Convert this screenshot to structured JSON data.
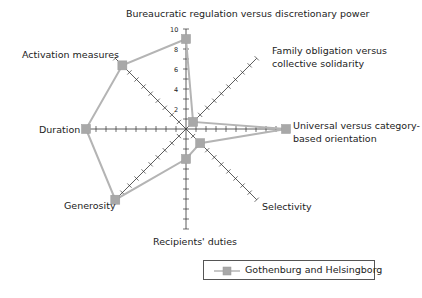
{
  "chart_data": {
    "type": "radar",
    "title": "",
    "axes": [
      "Bureaucratic regulation versus discretionary power",
      "Family obligation versus collective solidarity",
      "Universal versus category-based orientation",
      "Selectivity",
      "Recipients' duties",
      "Generosity",
      "Duration",
      "Activation measures"
    ],
    "tick_labels": [
      "2",
      "4",
      "6",
      "8",
      "10"
    ],
    "range": [
      0,
      10
    ],
    "series": [
      {
        "name": "Gothenburg and Helsingborg",
        "values": [
          9,
          1,
          10,
          2,
          3,
          10,
          10,
          9
        ],
        "color": "#b4b4b4",
        "marker": "square"
      }
    ],
    "legend_position": "bottom-right"
  },
  "labels": {
    "bureaucratic": "Bureaucratic regulation versus discretionary power",
    "family_1": "Family obligation versus",
    "family_2": "collective solidarity",
    "universal_1": "Universal versus category-",
    "universal_2": "based orientation",
    "selectivity": "Selectivity",
    "recipients": "Recipients' duties",
    "generosity": "Generosity",
    "duration": "Duration",
    "activation": "Activation measures"
  },
  "ticks": {
    "t2": "2",
    "t4": "4",
    "t6": "6",
    "t8": "8",
    "t10": "10"
  },
  "legend": {
    "label": "Gothenburg and Helsingborg"
  }
}
